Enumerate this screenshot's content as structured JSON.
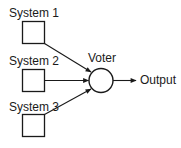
{
  "diagram": {
    "systems": [
      {
        "label": "System 1"
      },
      {
        "label": "System 2"
      },
      {
        "label": "System 3"
      }
    ],
    "voter": {
      "label": "Voter"
    },
    "output": {
      "label": "Output"
    },
    "colors": {
      "stroke": "#1a1a1a",
      "background": "#ffffff"
    }
  }
}
